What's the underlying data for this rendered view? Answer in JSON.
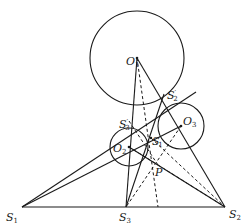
{
  "diagram": {
    "colors": {
      "stroke": "#1a1a1a",
      "background": "#ffffff"
    },
    "circles": [
      {
        "id": "O1",
        "cx": 137,
        "cy": 58,
        "r": 47
      },
      {
        "id": "O2",
        "cx": 129,
        "cy": 147,
        "r": 19
      },
      {
        "id": "O3",
        "cx": 181,
        "cy": 126,
        "r": 23
      }
    ],
    "labels": {
      "O1": {
        "base": "O",
        "sub": "1"
      },
      "O2": {
        "base": "O",
        "sub": "2"
      },
      "O3": {
        "base": "O",
        "sub": "3"
      },
      "S1": {
        "base": "S",
        "sub": "1"
      },
      "S2": {
        "base": "S",
        "sub": "2"
      },
      "S3": {
        "base": "S",
        "sub": "3"
      },
      "S1p": {
        "base": "S",
        "sub": "1",
        "prime": "′"
      },
      "S2p": {
        "base": "S",
        "sub": "2",
        "prime": "′"
      },
      "S3p": {
        "base": "S",
        "sub": "3",
        "prime": "′"
      },
      "P": {
        "base": "P"
      }
    },
    "points": {
      "S1": [
        22,
        207
      ],
      "S2": [
        225,
        207
      ],
      "S3": [
        126,
        207
      ],
      "S1p": [
        151,
        138
      ],
      "S2p": [
        164,
        94
      ],
      "S3p": [
        129,
        121
      ],
      "P": [
        158,
        165
      ]
    }
  }
}
